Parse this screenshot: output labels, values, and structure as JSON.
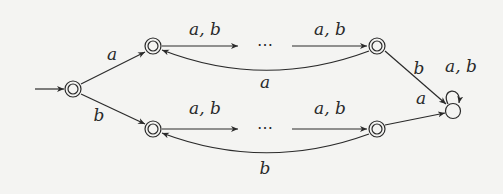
{
  "diagram": {
    "type": "finite-automaton",
    "states": [
      {
        "id": "q0",
        "x": 73,
        "y": 89,
        "accepting": true,
        "initial": true
      },
      {
        "id": "u1",
        "x": 153,
        "y": 46,
        "accepting": true
      },
      {
        "id": "un",
        "x": 377,
        "y": 46,
        "accepting": true
      },
      {
        "id": "l1",
        "x": 153,
        "y": 129,
        "accepting": true
      },
      {
        "id": "ln",
        "x": 377,
        "y": 129,
        "accepting": true
      },
      {
        "id": "sink",
        "x": 453,
        "y": 111,
        "accepting": false
      }
    ],
    "ellipsis": "⋯",
    "labels": {
      "q0_u1": "a",
      "q0_l1": "b",
      "u1_dots": "a, b",
      "dots_un": "a, b",
      "un_u1": "a",
      "l1_dots": "a, b",
      "dots_ln": "a, b",
      "ln_l1": "b",
      "un_sink": "b",
      "ln_sink": "a",
      "sink_loop": "a, b"
    },
    "colors": {
      "stroke": "#2a2a2a",
      "background": "#f4f4f2"
    }
  }
}
